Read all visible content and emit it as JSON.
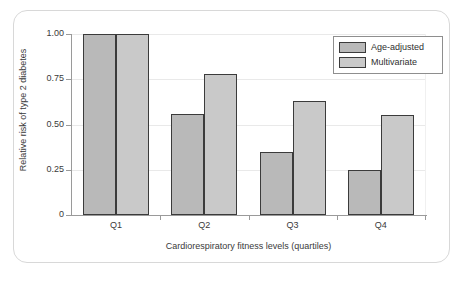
{
  "chart_data": {
    "type": "bar",
    "title": "",
    "xlabel": "Cardiorespiratory fitness levels (quartiles)",
    "ylabel": "Relative risk of type 2 diabetes",
    "categories": [
      "Q1",
      "Q2",
      "Q3",
      "Q4"
    ],
    "series": [
      {
        "name": "Age-adjusted",
        "color": "#b9b9b9",
        "values": [
          1.0,
          0.56,
          0.35,
          0.25
        ]
      },
      {
        "name": "Multivariate",
        "color": "#c9c9c9",
        "values": [
          1.0,
          0.78,
          0.63,
          0.55
        ]
      }
    ],
    "ylim": [
      0,
      1.0
    ],
    "yticks": [
      0,
      0.25,
      0.5,
      0.75,
      1.0
    ],
    "ytick_labels": [
      "0",
      "0.25",
      "0.50",
      "0.75",
      "1.00"
    ],
    "grid": "horizontal",
    "legend_position": "top-right",
    "bar_edge_color": "#3b3b3b",
    "grid_color": "#e9e9e9",
    "axis_color": "#9a9a9a",
    "frame_color": "#d8d8d8"
  },
  "legend": {
    "entries": [
      {
        "label": "Age-adjusted"
      },
      {
        "label": "Multivariate"
      }
    ]
  }
}
